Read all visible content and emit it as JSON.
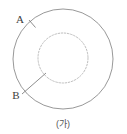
{
  "figure": {
    "caption": "(가)",
    "labels": {
      "outer": "A",
      "inner": "B"
    },
    "colors": {
      "background": "#ffffff",
      "outer_circle_stroke": "#8c8c8c",
      "inner_circle_stroke": "#b5b5b5",
      "leader_line_stroke": "#707070",
      "label_text": "#3d3d3d",
      "caption_text": "#555555"
    },
    "geometry": {
      "outer_circle": {
        "cx": 63,
        "cy": 59,
        "r": 50,
        "style": "solid"
      },
      "inner_circle": {
        "cx": 63,
        "cy": 58,
        "r": 25,
        "style": "dashed"
      },
      "leader_a": {
        "x1": 29,
        "y1": 20,
        "x2": 35,
        "y2": 27
      },
      "leader_b": {
        "x1": 22,
        "y1": 94,
        "x2": 46,
        "y2": 73
      },
      "label_a_pos": {
        "x": 20,
        "y": 20
      },
      "label_b_pos": {
        "x": 12,
        "y": 99
      },
      "caption_pos": {
        "x": 63,
        "y": 124
      }
    }
  }
}
